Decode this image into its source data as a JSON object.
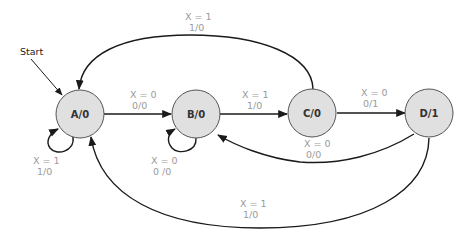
{
  "diagram": {
    "type": "finite-state-machine",
    "start_label": "Start",
    "start_state": "A/0",
    "colors": {
      "state_fill": "#e0e0e0",
      "state_stroke": "#555555",
      "edge": "#1a1a1a",
      "label": "#9a9a9a"
    },
    "states": [
      {
        "id": "A",
        "label": "A/0"
      },
      {
        "id": "B",
        "label": "B/0"
      },
      {
        "id": "C",
        "label": "C/0"
      },
      {
        "id": "D",
        "label": "D/1"
      }
    ],
    "transitions": [
      {
        "from": "A",
        "to": "B",
        "condition": "X = 0",
        "output": "0/0"
      },
      {
        "from": "A",
        "to": "A",
        "condition": "X = 1",
        "output": "1/0"
      },
      {
        "from": "B",
        "to": "C",
        "condition": "X = 1",
        "output": "1/0"
      },
      {
        "from": "B",
        "to": "B",
        "condition": "X = 0",
        "output": "0 /0"
      },
      {
        "from": "C",
        "to": "D",
        "condition": "X = 0",
        "output": "0/1"
      },
      {
        "from": "C",
        "to": "A",
        "condition": "X = 1",
        "output": "1/0"
      },
      {
        "from": "D",
        "to": "B",
        "condition": "X = 0",
        "output": "0/0"
      },
      {
        "from": "D",
        "to": "A",
        "condition": "X = 1",
        "output": "1/0"
      }
    ]
  }
}
